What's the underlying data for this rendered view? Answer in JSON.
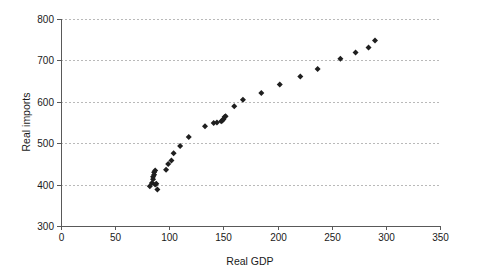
{
  "chart_data": {
    "type": "scatter",
    "title": "",
    "xlabel": "Real GDP",
    "ylabel": "Real imports",
    "xlim": [
      0,
      350
    ],
    "ylim": [
      300,
      800
    ],
    "xticks": [
      0,
      50,
      100,
      150,
      200,
      250,
      300,
      350
    ],
    "xtick_labels": [
      "0",
      "50",
      "100",
      "150",
      "200",
      "250",
      "300",
      "350"
    ],
    "yticks": [
      300,
      400,
      500,
      600,
      700,
      800
    ],
    "ytick_labels": [
      "300",
      "400",
      "500",
      "600",
      "700",
      "800"
    ],
    "grid": "horizontal-dashed",
    "legend": "none",
    "marker": "filled-diamond",
    "marker_color": "#1f1f1f",
    "grid_color": "#b9b9b9",
    "axis_color": "#595959",
    "background_color": "#ffffff",
    "points": [
      {
        "x": 82,
        "y": 396
      },
      {
        "x": 84,
        "y": 404
      },
      {
        "x": 85,
        "y": 413
      },
      {
        "x": 85,
        "y": 419
      },
      {
        "x": 86,
        "y": 424
      },
      {
        "x": 86,
        "y": 430
      },
      {
        "x": 87,
        "y": 434
      },
      {
        "x": 87,
        "y": 400
      },
      {
        "x": 88,
        "y": 402
      },
      {
        "x": 89,
        "y": 388
      },
      {
        "x": 97,
        "y": 436
      },
      {
        "x": 99,
        "y": 450
      },
      {
        "x": 102,
        "y": 458
      },
      {
        "x": 104,
        "y": 476
      },
      {
        "x": 110,
        "y": 493
      },
      {
        "x": 118,
        "y": 515
      },
      {
        "x": 133,
        "y": 541
      },
      {
        "x": 141,
        "y": 549
      },
      {
        "x": 144,
        "y": 550
      },
      {
        "x": 148,
        "y": 553
      },
      {
        "x": 149,
        "y": 555
      },
      {
        "x": 150,
        "y": 558
      },
      {
        "x": 151,
        "y": 563
      },
      {
        "x": 152,
        "y": 565
      },
      {
        "x": 160,
        "y": 589
      },
      {
        "x": 168,
        "y": 605
      },
      {
        "x": 185,
        "y": 621
      },
      {
        "x": 202,
        "y": 642
      },
      {
        "x": 221,
        "y": 661
      },
      {
        "x": 237,
        "y": 679
      },
      {
        "x": 258,
        "y": 704
      },
      {
        "x": 272,
        "y": 719
      },
      {
        "x": 284,
        "y": 731
      },
      {
        "x": 290,
        "y": 748
      }
    ]
  },
  "chart": {
    "xlabel": "Real GDP",
    "ylabel": "Real imports"
  }
}
